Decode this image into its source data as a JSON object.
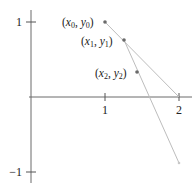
{
  "diagram": {
    "title": "",
    "x_ticks": [
      {
        "value": 1,
        "label": "1"
      },
      {
        "value": 2,
        "label": "2"
      }
    ],
    "y_ticks": [
      {
        "value": 1,
        "label": "1"
      },
      {
        "value": -1,
        "label": "−1"
      }
    ],
    "points": [
      {
        "name": "p0",
        "label_var_x": "x",
        "label_var_y": "y",
        "subscript": "0",
        "x": 1.0,
        "y": 1.0
      },
      {
        "name": "p1",
        "label_var_x": "x",
        "label_var_y": "y",
        "subscript": "1",
        "x": 1.26,
        "y": 0.76
      },
      {
        "name": "p2",
        "label_var_x": "x",
        "label_var_y": "y",
        "subscript": "2",
        "x": 1.43,
        "y": 0.33
      }
    ],
    "lines": [
      {
        "name": "tangent-from-p0",
        "from": [
          1.0,
          1.0
        ],
        "to": [
          2.0,
          0.0
        ]
      },
      {
        "name": "tangent-from-p1",
        "from": [
          1.26,
          0.76
        ],
        "to": [
          2.0,
          -0.88
        ]
      }
    ],
    "axis_range": {
      "x": [
        0,
        2.15
      ],
      "y": [
        -1.15,
        1.15
      ]
    },
    "colors": {
      "axis": "#6a6a6a",
      "tangent": "#bdbdbd",
      "point": "#6a6a6a",
      "text": "#222222"
    }
  }
}
